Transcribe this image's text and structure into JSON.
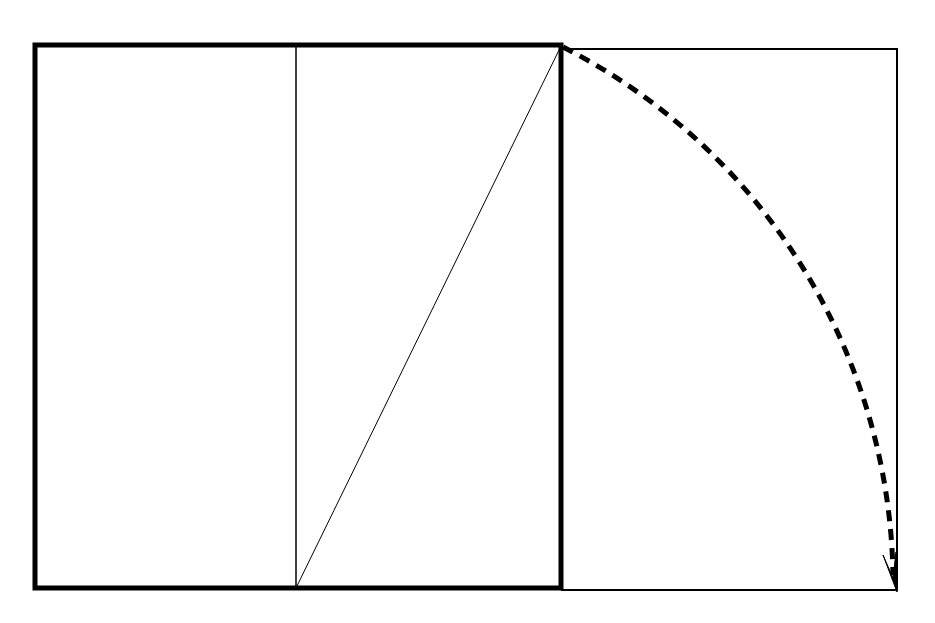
{
  "diagram": {
    "colors": {
      "stroke": "#000000",
      "background": "#ffffff"
    },
    "square": {
      "x": 35,
      "y": 45,
      "width": 526,
      "height": 543,
      "stroke_width": 5
    },
    "midline": {
      "x": 296,
      "y1": 45,
      "y2": 588,
      "stroke_width": 1.5
    },
    "diagonal": {
      "x1": 296,
      "y1": 588,
      "x2": 561,
      "y2": 45,
      "stroke_width": 1
    },
    "extension_rect": {
      "x1": 561,
      "y1": 48,
      "x2": 897,
      "y2": 590,
      "stroke_width": 2
    },
    "arc": {
      "from": [
        561,
        45
      ],
      "to": [
        893,
        588
      ],
      "center": [
        296,
        588
      ],
      "style": "dashed",
      "stroke_width": 5,
      "arrowhead": "at end"
    }
  }
}
